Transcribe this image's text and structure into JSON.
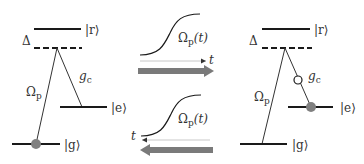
{
  "colors": {
    "line": "#1a1a1a",
    "thin_line": "#333333",
    "dot": "#808080",
    "arrow": "#7a7a7a",
    "axis": "#c8c8c8",
    "text": "#333333"
  },
  "left_panel": {
    "state_r": "|r⟩",
    "state_e": "|e⟩",
    "state_g": "|g⟩",
    "detuning": "Δ",
    "probe": "Ω",
    "probe_sub": "p",
    "coupling": "g",
    "coupling_sub": "c"
  },
  "middle_top": {
    "pulse_label": "Ω",
    "pulse_sub": "p",
    "pulse_arg": "(t)",
    "axis_label": "t",
    "direction": "right"
  },
  "middle_bottom": {
    "pulse_label": "Ω",
    "pulse_sub": "p",
    "pulse_arg": "(t)",
    "axis_label": "t",
    "direction": "left"
  },
  "right_panel": {
    "state_r": "|r⟩",
    "state_e": "|e⟩",
    "state_g": "|g⟩",
    "detuning": "Δ",
    "probe": "Ω",
    "probe_sub": "p",
    "coupling": "g",
    "coupling_sub": "c"
  }
}
